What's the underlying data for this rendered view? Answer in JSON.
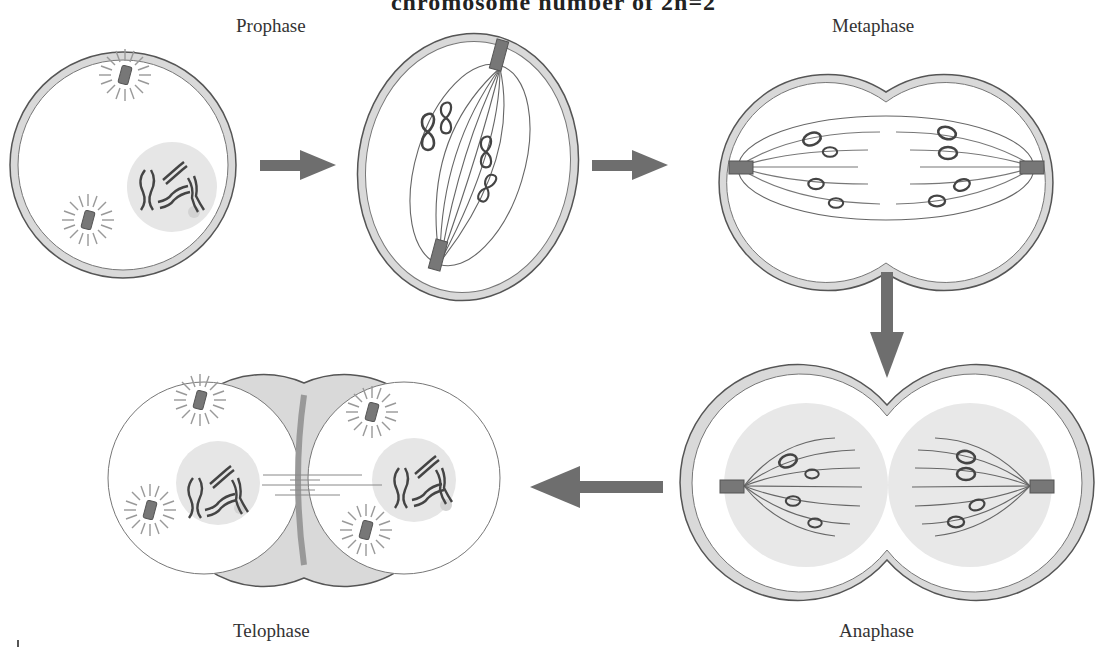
{
  "figure": {
    "title": "chromosome number of 2n=2",
    "stages": [
      {
        "id": "prophase",
        "label": "Prophase",
        "order": 1
      },
      {
        "id": "prometaphase",
        "label": "",
        "order": 2
      },
      {
        "id": "metaphase",
        "label": "Metaphase",
        "order": 3
      },
      {
        "id": "anaphase",
        "label": "Anaphase",
        "order": 4
      },
      {
        "id": "telophase",
        "label": "Telophase",
        "order": 5
      }
    ],
    "arrows": [
      {
        "from": "prophase",
        "to": "prometaphase",
        "direction": "right"
      },
      {
        "from": "prometaphase",
        "to": "metaphase",
        "direction": "right"
      },
      {
        "from": "metaphase",
        "to": "anaphase",
        "direction": "down"
      },
      {
        "from": "anaphase",
        "to": "telophase",
        "direction": "left"
      }
    ],
    "colors": {
      "membrane": "#d9d9d9",
      "outline": "#555555",
      "arrow": "#6e6e6e",
      "centrosome": "#777777",
      "nucleus": "#e6e6e6"
    }
  }
}
